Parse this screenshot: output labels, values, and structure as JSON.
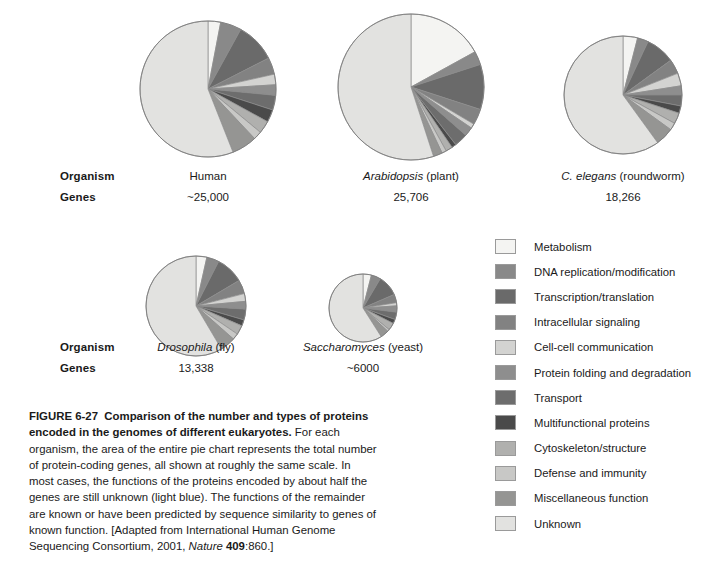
{
  "figure": {
    "number": "FIGURE 6-27",
    "title": "Comparison of the number and types of proteins encoded in the genomes of different eukaryotes.",
    "body_1": "For each organism, the area of the entire pie chart represents the total number of protein-coding genes, all shown at roughly the same scale. In most cases, the functions of the proteins encoded by about half the genes are still unknown (light blue). The functions of the remainder are known or have been predicted by sequence similarity to genes of known function. [Adapted from International Human Genome Sequencing Consortium, 2001, ",
    "source_journal": "Nature",
    "source_volume": "409",
    "source_pages": ":860.]"
  },
  "row_labels": {
    "organism": "Organism",
    "genes": "Genes"
  },
  "legend": {
    "items": [
      {
        "label": "Metabolism",
        "color": "#f4f4f2"
      },
      {
        "label": "DNA replication/modification",
        "color": "#898989"
      },
      {
        "label": "Transcription/translation",
        "color": "#6a6a6a"
      },
      {
        "label": "Intracellular signaling",
        "color": "#828282"
      },
      {
        "label": "Cell-cell communication",
        "color": "#d3d3d1"
      },
      {
        "label": "Protein folding and degradation",
        "color": "#8e8e8e"
      },
      {
        "label": "Transport",
        "color": "#6d6d6d"
      },
      {
        "label": "Multifunctional proteins",
        "color": "#4a4a4a"
      },
      {
        "label": "Cytoskeleton/structure",
        "color": "#b0b0ae"
      },
      {
        "label": "Defense and immunity",
        "color": "#c8c8c6"
      },
      {
        "label": "Miscellaneous function",
        "color": "#959593"
      },
      {
        "label": "Unknown",
        "color": "#e2e2e0"
      }
    ]
  },
  "chart_data": {
    "type": "pie",
    "title": "Comparison of the number and types of proteins encoded in the genomes of different eukaryotes",
    "note": "Slice areas scale with total gene count; each pie starts at 12 o'clock and proceeds clockwise.",
    "categories": [
      "Metabolism",
      "DNA replication/modification",
      "Transcription/translation",
      "Intracellular signaling",
      "Cell-cell communication",
      "Protein folding and degradation",
      "Transport",
      "Multifunctional proteins",
      "Cytoskeleton/structure",
      "Defense and immunity",
      "Miscellaneous function",
      "Unknown"
    ],
    "charts": [
      {
        "key": "human",
        "organism_name": "Human",
        "organism_italic": false,
        "organism_common": "",
        "genes_label": "~25,000",
        "genes_value": 25000,
        "cx": 208,
        "cy": 89,
        "r": 68,
        "values": [
          3.0,
          5.0,
          9.5,
          4.0,
          2.5,
          2.5,
          3.5,
          3.0,
          3.0,
          2.0,
          6.0,
          56.0
        ]
      },
      {
        "key": "arabidopsis",
        "organism_name": "Arabidopsis",
        "organism_italic": true,
        "organism_common": " (plant)",
        "genes_label": "25,706",
        "genes_value": 25706,
        "cx": 411,
        "cy": 87,
        "r": 73,
        "values": [
          17.0,
          3.0,
          10.0,
          3.5,
          1.0,
          2.0,
          3.0,
          1.0,
          1.5,
          1.0,
          2.0,
          55.0
        ]
      },
      {
        "key": "celegans",
        "organism_name": "C. elegans",
        "organism_italic": true,
        "organism_common": " (roundworm)",
        "genes_label": "18,266",
        "genes_value": 18266,
        "cx": 623,
        "cy": 95,
        "r": 59,
        "values": [
          4.0,
          3.0,
          8.0,
          4.0,
          3.5,
          2.5,
          3.0,
          2.0,
          3.0,
          2.0,
          5.0,
          60.0
        ]
      },
      {
        "key": "drosophila",
        "organism_name": "Drosophila",
        "organism_italic": true,
        "organism_common": " (fly)",
        "genes_label": "13,338",
        "genes_value": 13338,
        "cx": 196,
        "cy": 306,
        "r": 50,
        "values": [
          3.5,
          4.0,
          9.0,
          4.5,
          2.5,
          2.5,
          3.5,
          2.0,
          3.0,
          2.0,
          5.0,
          58.5
        ]
      },
      {
        "key": "saccharomyces",
        "organism_name": "Saccharomyces",
        "organism_italic": true,
        "organism_common": " (yeast)",
        "genes_label": "~6000",
        "genes_value": 6000,
        "cx": 363,
        "cy": 308,
        "r": 34,
        "values": [
          4.0,
          4.5,
          10.0,
          4.0,
          1.5,
          3.0,
          3.5,
          2.0,
          3.5,
          1.0,
          4.0,
          59.0
        ]
      }
    ]
  },
  "layout": {
    "row1": {
      "organism_y": 170,
      "genes_y": 191
    },
    "row2": {
      "organism_y": 341,
      "genes_y": 362
    },
    "label_x": 60
  }
}
